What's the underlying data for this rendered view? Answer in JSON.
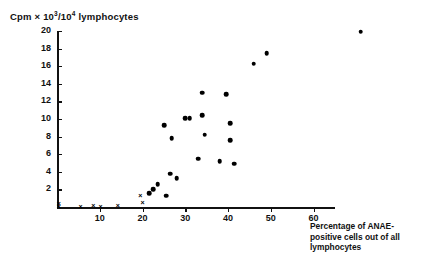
{
  "chart_data": {
    "type": "scatter",
    "title": "",
    "ylabel": "Cpm × 10³/10⁴ lymphocytes",
    "ylabel_parts": {
      "prefix": "Cpm × 10",
      "sup1": "3",
      "mid": "/10",
      "sup2": "4",
      "suffix": " lymphocytes"
    },
    "xlabel": "Percentage of ANAE-positive cells out of all lymphocytes",
    "xlabel_lines": [
      "Percentage of ANAE-",
      "positive cells out of all",
      "lymphocytes"
    ],
    "xlim": [
      0,
      65
    ],
    "ylim": [
      0,
      20
    ],
    "xticks": [
      10,
      20,
      30,
      40,
      50,
      60
    ],
    "yticks": [
      2,
      4,
      6,
      8,
      10,
      12,
      14,
      16,
      18,
      20
    ],
    "grid": false,
    "legend": "none",
    "series": [
      {
        "name": "filled-circle",
        "marker": "filled-circle",
        "points": [
          {
            "x": 21.5,
            "y": 1.6
          },
          {
            "x": 22.5,
            "y": 2.0
          },
          {
            "x": 23.5,
            "y": 2.6
          },
          {
            "x": 25.5,
            "y": 1.3
          },
          {
            "x": 26.5,
            "y": 3.8
          },
          {
            "x": 28.0,
            "y": 3.3
          },
          {
            "x": 25.0,
            "y": 9.3
          },
          {
            "x": 26.8,
            "y": 7.8
          },
          {
            "x": 30.0,
            "y": 10.1
          },
          {
            "x": 31.0,
            "y": 10.1
          },
          {
            "x": 33.0,
            "y": 5.5
          },
          {
            "x": 34.0,
            "y": 13.0
          },
          {
            "x": 34.0,
            "y": 10.4
          },
          {
            "x": 34.5,
            "y": 8.2
          },
          {
            "x": 38.0,
            "y": 5.2
          },
          {
            "x": 39.5,
            "y": 12.8
          },
          {
            "x": 40.5,
            "y": 7.6
          },
          {
            "x": 40.5,
            "y": 9.5
          },
          {
            "x": 41.5,
            "y": 4.9
          },
          {
            "x": 46.0,
            "y": 16.3
          },
          {
            "x": 49.0,
            "y": 17.5
          },
          {
            "x": 71.0,
            "y": 19.9
          }
        ]
      },
      {
        "name": "cross",
        "marker": "cross",
        "points": [
          {
            "x": 0.4,
            "y": 0.3
          },
          {
            "x": 0.4,
            "y": 0.0
          },
          {
            "x": 5.5,
            "y": 0.0
          },
          {
            "x": 8.5,
            "y": 0.1
          },
          {
            "x": 10.2,
            "y": 0.0
          },
          {
            "x": 14.2,
            "y": 0.1
          },
          {
            "x": 19.5,
            "y": 1.3
          },
          {
            "x": 20.0,
            "y": 0.4
          }
        ]
      }
    ]
  }
}
